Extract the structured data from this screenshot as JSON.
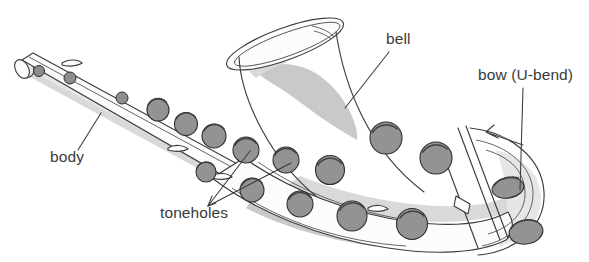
{
  "figure": {
    "background_color": "#ffffff",
    "line_color": "#3d3d3d",
    "label_color": "#3a3a3a",
    "tonehole_fill": "#939393",
    "shading_color": "#c9c9c9",
    "labels": [
      {
        "id": "bell",
        "text": "bell",
        "x": 386,
        "y": 44
      },
      {
        "id": "bow",
        "text": "bow (U-bend)",
        "x": 478,
        "y": 80
      },
      {
        "id": "body",
        "text": "body",
        "x": 50,
        "y": 162
      },
      {
        "id": "toneholes",
        "text": "toneholes",
        "x": 160,
        "y": 218
      }
    ],
    "parts": [
      {
        "name": "bell",
        "description": "flared open end of the saxophone"
      },
      {
        "name": "bow (U-bend)",
        "description": "U-shaped bend at the bottom of the instrument"
      },
      {
        "name": "body",
        "description": "main tube of the saxophone"
      },
      {
        "name": "toneholes",
        "description": "circular holes along the body covered by pads"
      }
    ]
  }
}
